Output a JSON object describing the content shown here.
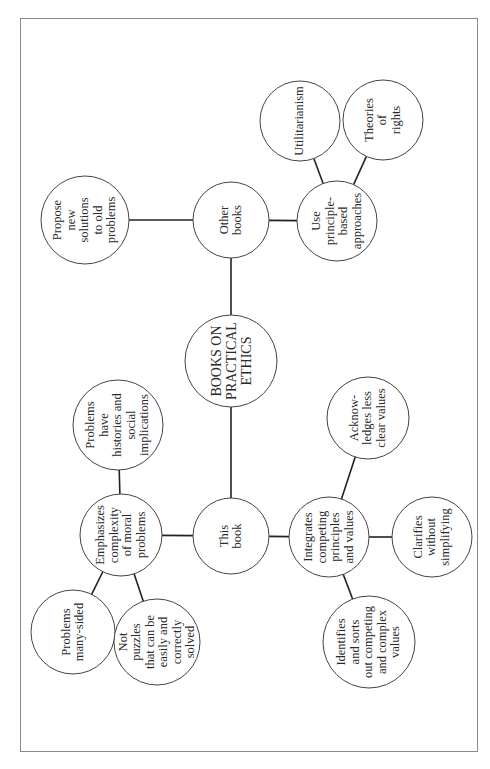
{
  "diagram": {
    "title": "BOOKS ON PRACTICAL ETHICS",
    "orientation": "rotated 90° counter-clockwise",
    "border_color": "#8a8a8a",
    "line_color": "#222222",
    "nodes": [
      {
        "id": "root",
        "label": "BOOKS ON\nPRACTICAL\nETHICS",
        "cx": 231,
        "cy": 361,
        "r": 46
      },
      {
        "id": "other_books",
        "label": "Other\nbooks",
        "cx": 231,
        "cy": 220,
        "r": 38
      },
      {
        "id": "propose",
        "label": "Propose\nnew\nsolutions\nto old\nproblems",
        "cx": 85,
        "cy": 220,
        "r": 44
      },
      {
        "id": "principle",
        "label": "Use\nprinciple-\nbased\napproaches",
        "cx": 337,
        "cy": 221,
        "r": 40
      },
      {
        "id": "utilitarianism",
        "label": "Utilitarianism",
        "cx": 300,
        "cy": 121,
        "r": 40
      },
      {
        "id": "rights",
        "label": "Theories\nof\nrights",
        "cx": 383,
        "cy": 120,
        "r": 40
      },
      {
        "id": "this_book",
        "label": "This\nbook",
        "cx": 231,
        "cy": 536,
        "r": 38
      },
      {
        "id": "emphasizes",
        "label": "Emphasizes\ncomplexity\nof moral\nproblems",
        "cx": 121,
        "cy": 535,
        "r": 41
      },
      {
        "id": "histories",
        "label": "Problems\nhave\nhistories and\nsocial\nimplications",
        "cx": 118,
        "cy": 425,
        "r": 45
      },
      {
        "id": "many_sided",
        "label": "Problems\nmany-sided",
        "cx": 73,
        "cy": 632,
        "r": 42
      },
      {
        "id": "puzzles",
        "label": "Not\npuzzles\nthat can be\neasily and\ncorrectly\nsolved",
        "cx": 157,
        "cy": 642,
        "r": 43
      },
      {
        "id": "integrates",
        "label": "Integrates\ncompeting\nprinciples\nand values",
        "cx": 329,
        "cy": 537,
        "r": 40
      },
      {
        "id": "acknowledges",
        "label": "Acknow-\nledges less\nclear values",
        "cx": 368,
        "cy": 418,
        "r": 41
      },
      {
        "id": "clarifies",
        "label": "Clarifies\nwithout\nsimplifying",
        "cx": 432,
        "cy": 537,
        "r": 40
      },
      {
        "id": "identifies",
        "label": "Identifies\nand sorts\nout competing\nand complex\nvalues",
        "cx": 369,
        "cy": 642,
        "r": 46
      }
    ],
    "edges": [
      [
        "root",
        "other_books"
      ],
      [
        "root",
        "this_book"
      ],
      [
        "other_books",
        "propose"
      ],
      [
        "other_books",
        "principle"
      ],
      [
        "principle",
        "utilitarianism"
      ],
      [
        "principle",
        "rights"
      ],
      [
        "this_book",
        "emphasizes"
      ],
      [
        "this_book",
        "integrates"
      ],
      [
        "emphasizes",
        "histories"
      ],
      [
        "emphasizes",
        "many_sided"
      ],
      [
        "emphasizes",
        "puzzles"
      ],
      [
        "integrates",
        "acknowledges"
      ],
      [
        "integrates",
        "clarifies"
      ],
      [
        "integrates",
        "identifies"
      ]
    ]
  }
}
